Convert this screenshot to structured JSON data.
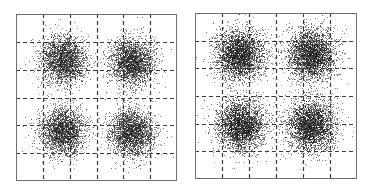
{
  "chart_data": [
    {
      "type": "scatter",
      "title": "",
      "xlabel": "",
      "ylabel": "",
      "xlim": [
        -3,
        3
      ],
      "ylim": [
        -3,
        3
      ],
      "grid": true,
      "grid_style": "dashed",
      "grid_ticks": [
        -2,
        -1,
        0,
        1,
        2
      ],
      "legend": null,
      "series": [
        {
          "name": "received symbols",
          "clusters": [
            {
              "center": [
                -1.25,
                1.35
              ],
              "std": 0.42,
              "points": 2600
            },
            {
              "center": [
                1.3,
                1.3
              ],
              "std": 0.42,
              "points": 2600
            },
            {
              "center": [
                -1.25,
                -1.2
              ],
              "std": 0.42,
              "points": 2600
            },
            {
              "center": [
                1.3,
                -1.25
              ],
              "std": 0.42,
              "points": 2600
            }
          ],
          "color": "#1e1e1e"
        }
      ],
      "seed": 7
    },
    {
      "type": "scatter",
      "title": "",
      "xlabel": "",
      "ylabel": "",
      "xlim": [
        -3,
        3
      ],
      "ylim": [
        -3,
        3
      ],
      "grid": true,
      "grid_style": "dashed",
      "grid_ticks": [
        -2,
        -1,
        0,
        1,
        2
      ],
      "legend": null,
      "series": [
        {
          "name": "received symbols",
          "clusters": [
            {
              "center": [
                -1.35,
                1.5
              ],
              "std": 0.45,
              "points": 3000
            },
            {
              "center": [
                1.3,
                1.5
              ],
              "std": 0.45,
              "points": 3000
            },
            {
              "center": [
                -1.3,
                -1.05
              ],
              "std": 0.45,
              "points": 3000
            },
            {
              "center": [
                1.3,
                -1.05
              ],
              "std": 0.45,
              "points": 3000
            }
          ],
          "color": "#141414"
        }
      ],
      "seed": 13
    }
  ],
  "plots": {
    "left": {
      "label": "Constellation plot A"
    },
    "right": {
      "label": "Constellation plot B"
    }
  },
  "colors": {
    "frame": "#6e6e6e",
    "grid": "#3a3a3a",
    "background": "#ffffff"
  }
}
